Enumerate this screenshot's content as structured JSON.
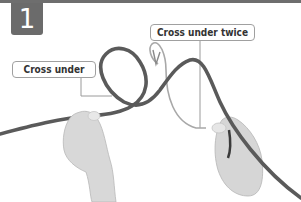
{
  "step": {
    "number": "1"
  },
  "labels": {
    "cross_under": "Cross under",
    "cross_under_twice": "Cross under twice"
  },
  "colors": {
    "badge": "#6b6b6b",
    "rope": "#5a5a5a",
    "guide_line": "#9a9a9a",
    "skin": "#d8d8d8",
    "background": "#ffffff"
  }
}
